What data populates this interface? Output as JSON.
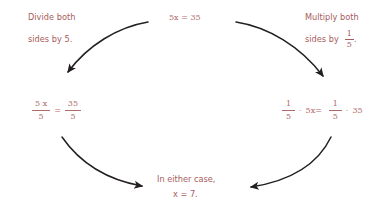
{
  "colors": {
    "text": "#a85c5c",
    "math": "#b06a6a",
    "arrow": "#231f20",
    "background": "#ffffff"
  },
  "equation_top": {
    "coefficient": "5",
    "variable": "x",
    "equals": "=",
    "right": "35",
    "full": "5x = 35"
  },
  "instruction_left": {
    "line1": "Divide both",
    "line2": "sides by 5."
  },
  "instruction_right": {
    "line1": "Multiply both",
    "line2_label": "sides by",
    "fraction_numerator": "1",
    "fraction_denominator": "5",
    "trailing": "."
  },
  "equation_left": {
    "left_numerator": "5 x",
    "left_denominator": "5",
    "operator": "=",
    "right_numerator": "35",
    "right_denominator": "5"
  },
  "equation_right": {
    "a_numerator": "1",
    "a_denominator": "5",
    "dot1": "·",
    "term1": "5x",
    "equals": "=",
    "b_numerator": "1",
    "b_denominator": "5",
    "dot2": "·",
    "term2": "35"
  },
  "conclusion": {
    "line1": "In either case,",
    "line2": "x = 7."
  },
  "arrows": [
    {
      "name": "arrow-top-left",
      "direction": "down-left"
    },
    {
      "name": "arrow-top-right",
      "direction": "down-right"
    },
    {
      "name": "arrow-bottom-left",
      "direction": "down-right"
    },
    {
      "name": "arrow-bottom-right",
      "direction": "down-left"
    }
  ]
}
